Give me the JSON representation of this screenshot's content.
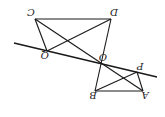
{
  "diagram": {
    "rotation_deg": 180,
    "stroke_color": "#1a1a1a",
    "points": {
      "A": {
        "label": "A",
        "x": 143,
        "y": 91
      },
      "B": {
        "label": "B",
        "x": 95,
        "y": 91
      },
      "C": {
        "label": "C",
        "x": 35,
        "y": 19
      },
      "D": {
        "label": "D",
        "x": 111,
        "y": 19
      },
      "O": {
        "label": "O",
        "x": 100,
        "y": 63
      },
      "P": {
        "label": "P",
        "x": 137,
        "y": 72
      },
      "Q": {
        "label": "Q",
        "x": 47,
        "y": 51
      }
    },
    "segments": [
      [
        "C",
        "D"
      ],
      [
        "C",
        "Q"
      ],
      [
        "C",
        "A"
      ],
      [
        "D",
        "Q"
      ],
      [
        "D",
        "B"
      ],
      [
        "B",
        "A"
      ],
      [
        "A",
        "P"
      ],
      [
        "B",
        "P"
      ]
    ],
    "transversal": {
      "x1": 14,
      "y1": 43,
      "x2": 157,
      "y2": 77
    }
  }
}
